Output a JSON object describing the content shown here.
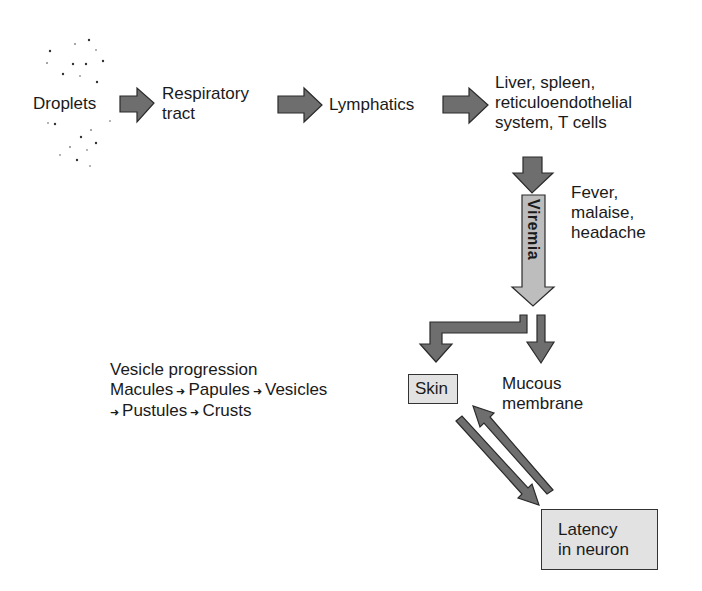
{
  "diagram": {
    "nodes": {
      "droplets": "Droplets",
      "respiratory_1": "Respiratory",
      "respiratory_2": "tract",
      "lymphatics": "Lymphatics",
      "organs_1": "Liver, spleen,",
      "organs_2": "reticuloendothelial",
      "organs_3": "system, T cells",
      "viremia": "Viremia",
      "symptoms_1": "Fever,",
      "symptoms_2": "malaise,",
      "symptoms_3": "headache",
      "skin": "Skin",
      "mucous_1": "Mucous",
      "mucous_2": "membrane",
      "latency_1": "Latency",
      "latency_2": "in neuron"
    },
    "vesicle_progression": {
      "heading": "Vesicle progression",
      "stages": [
        "Macules",
        "Papules",
        "Vesicles",
        "Pustules",
        "Crusts"
      ]
    },
    "edges": [
      {
        "from": "Droplets",
        "to": "Respiratory tract"
      },
      {
        "from": "Respiratory tract",
        "to": "Lymphatics"
      },
      {
        "from": "Lymphatics",
        "to": "Liver, spleen, reticuloendothelial system, T cells"
      },
      {
        "from": "Liver, spleen, reticuloendothelial system, T cells",
        "to": "Viremia"
      },
      {
        "from": "Viremia",
        "to": "Skin"
      },
      {
        "from": "Viremia",
        "to": "Mucous membrane"
      },
      {
        "from": "Skin",
        "to": "Latency in neuron"
      },
      {
        "from": "Latency in neuron",
        "to": "Skin"
      }
    ],
    "colors": {
      "arrow_fill": "#6e6e6e",
      "viremia_fill": "#bdbdbd",
      "box_fill": "#e2e2e2",
      "outline": "#2a2a2a"
    }
  }
}
